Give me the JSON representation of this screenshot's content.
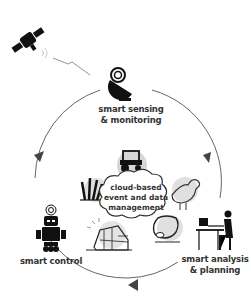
{
  "diagram": {
    "nodes": [
      {
        "id": "sensing",
        "label_line1": "smart sensing",
        "label_line2": "& monitoring",
        "icon": "satellite-dish-icon"
      },
      {
        "id": "analysis",
        "label_line1": "smart analysis",
        "label_line2": "& planning",
        "icon": "person-at-computer-icon"
      },
      {
        "id": "control",
        "label_line1": "smart control",
        "icon": "robot-icon"
      }
    ],
    "center": {
      "line1": "cloud-based",
      "line2": "event and data",
      "line3": "management",
      "icon": "cloud-icon"
    },
    "center_icons": [
      "tractor-icon",
      "rooster-icon",
      "cow-icon",
      "greenhouse-icon",
      "crop-plant-icon"
    ],
    "external": {
      "icon": "satellite-icon"
    },
    "cycle_direction": "clockwise",
    "colors": {
      "line": "#555555",
      "icon": "#111111",
      "text": "#333333",
      "shade": "#d8d8d8"
    }
  }
}
